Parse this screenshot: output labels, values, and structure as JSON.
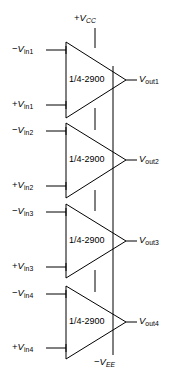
{
  "diagram": {
    "background_color": "#ffffff",
    "line_color": "#000000",
    "text_color": "#000000",
    "power": {
      "positive_rail": {
        "sign": "+",
        "symbol": "V",
        "subscript": "CC"
      },
      "negative_rail": {
        "sign": "−",
        "symbol": "V",
        "subscript": "EE"
      }
    },
    "amplifiers": [
      {
        "id": "amp1",
        "chip_label": "1/4-2900",
        "inverting_input": {
          "sign": "−",
          "symbol": "V",
          "subscript": "in1"
        },
        "noninverting_input": {
          "sign": "+",
          "symbol": "V",
          "subscript": "in1"
        },
        "output": {
          "symbol": "V",
          "subscript": "out1"
        }
      },
      {
        "id": "amp2",
        "chip_label": "1/4-2900",
        "inverting_input": {
          "sign": "−",
          "symbol": "V",
          "subscript": "in2"
        },
        "noninverting_input": {
          "sign": "+",
          "symbol": "V",
          "subscript": "in2"
        },
        "output": {
          "symbol": "V",
          "subscript": "out2"
        }
      },
      {
        "id": "amp3",
        "chip_label": "1/4-2900",
        "inverting_input": {
          "sign": "−",
          "symbol": "V",
          "subscript": "in3"
        },
        "noninverting_input": {
          "sign": "+",
          "symbol": "V",
          "subscript": "in3"
        },
        "output": {
          "symbol": "V",
          "subscript": "out3"
        }
      },
      {
        "id": "amp4",
        "chip_label": "1/4-2900",
        "inverting_input": {
          "sign": "−",
          "symbol": "V",
          "subscript": "in4"
        },
        "noninverting_input": {
          "sign": "+",
          "symbol": "V",
          "subscript": "in4"
        },
        "output": {
          "symbol": "V",
          "subscript": "out4"
        }
      }
    ]
  }
}
